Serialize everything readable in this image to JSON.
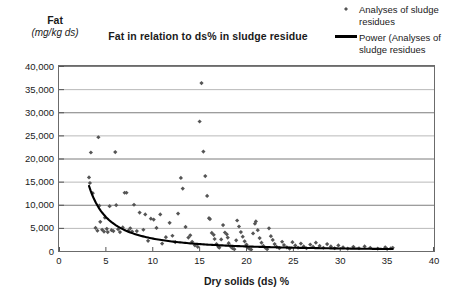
{
  "chart_data": {
    "type": "scatter",
    "title": "Fat in relation to ds% in sludge residue",
    "ylabel_main": "Fat",
    "ylabel_units": "(mg/kg ds)",
    "xlabel": "Dry solids (ds) %",
    "xlim": [
      0,
      40
    ],
    "ylim": [
      0,
      40000
    ],
    "xticks": [
      0,
      5,
      10,
      15,
      20,
      25,
      30,
      35,
      40
    ],
    "xtick_labels": [
      "0",
      "5",
      "10",
      "15",
      "20",
      "25",
      "30",
      "35",
      "40"
    ],
    "yticks": [
      0,
      5000,
      10000,
      15000,
      20000,
      25000,
      30000,
      35000,
      40000
    ],
    "ytick_labels": [
      "0",
      "5,000",
      "10,000",
      "15,000",
      "20,000",
      "25,000",
      "30,000",
      "35,000",
      "40,000"
    ],
    "grid": "horizontal",
    "grid_color": "#9a9a9a",
    "legend_position": "top-right",
    "marker_color": "#555555",
    "marker_shape": "diamond",
    "trendline_color": "#000000",
    "legend": [
      {
        "label": "Analyses of sludge residues",
        "kind": "marker"
      },
      {
        "label": "Power (Analyses of sludge residues",
        "kind": "line"
      }
    ],
    "trendline": {
      "type": "power",
      "coefficient": 76000,
      "exponent": -1.45,
      "x_start": 3.2,
      "x_end": 35.6
    },
    "series": [
      {
        "name": "Analyses of sludge residues",
        "points": [
          [
            4.2,
            24600
          ],
          [
            3.4,
            21300
          ],
          [
            3.2,
            15900
          ],
          [
            3.3,
            14700
          ],
          [
            3.6,
            12500
          ],
          [
            3.9,
            5000
          ],
          [
            4.1,
            4400
          ],
          [
            4.3,
            9800
          ],
          [
            4.4,
            6300
          ],
          [
            4.6,
            4600
          ],
          [
            4.8,
            4200
          ],
          [
            4.9,
            7200
          ],
          [
            5.1,
            4800
          ],
          [
            5.2,
            4100
          ],
          [
            5.4,
            9700
          ],
          [
            5.6,
            4500
          ],
          [
            5.8,
            4300
          ],
          [
            6.0,
            21400
          ],
          [
            6.1,
            9900
          ],
          [
            6.3,
            4700
          ],
          [
            6.5,
            4100
          ],
          [
            6.8,
            5100
          ],
          [
            7.0,
            12600
          ],
          [
            7.2,
            12600
          ],
          [
            7.4,
            4400
          ],
          [
            7.6,
            4900
          ],
          [
            7.8,
            4200
          ],
          [
            8.0,
            10000
          ],
          [
            8.3,
            4300
          ],
          [
            8.6,
            8300
          ],
          [
            9.0,
            4600
          ],
          [
            9.2,
            7900
          ],
          [
            9.5,
            2200
          ],
          [
            9.8,
            7000
          ],
          [
            10.1,
            6800
          ],
          [
            10.4,
            5000
          ],
          [
            10.8,
            7900
          ],
          [
            11.0,
            1600
          ],
          [
            11.4,
            3000
          ],
          [
            11.8,
            6100
          ],
          [
            12.1,
            3300
          ],
          [
            12.4,
            1900
          ],
          [
            12.7,
            8100
          ],
          [
            13.0,
            15800
          ],
          [
            13.2,
            13500
          ],
          [
            13.5,
            5200
          ],
          [
            13.8,
            2900
          ],
          [
            14.0,
            3400
          ],
          [
            14.2,
            2000
          ],
          [
            14.5,
            1200
          ],
          [
            14.8,
            900
          ],
          [
            15.0,
            28000
          ],
          [
            15.2,
            36300
          ],
          [
            15.4,
            21500
          ],
          [
            15.6,
            16200
          ],
          [
            15.8,
            11900
          ],
          [
            16.0,
            7100
          ],
          [
            16.1,
            6900
          ],
          [
            16.3,
            3900
          ],
          [
            16.5,
            3500
          ],
          [
            16.6,
            2600
          ],
          [
            16.8,
            1500
          ],
          [
            17.0,
            900
          ],
          [
            17.1,
            700
          ],
          [
            17.3,
            2500
          ],
          [
            17.5,
            5600
          ],
          [
            17.7,
            4000
          ],
          [
            17.9,
            3600
          ],
          [
            18.0,
            2900
          ],
          [
            18.1,
            1700
          ],
          [
            18.3,
            1000
          ],
          [
            18.5,
            600
          ],
          [
            18.7,
            400
          ],
          [
            18.9,
            2300
          ],
          [
            19.0,
            6600
          ],
          [
            19.2,
            5300
          ],
          [
            19.4,
            4100
          ],
          [
            19.6,
            3100
          ],
          [
            19.8,
            2100
          ],
          [
            20.0,
            1400
          ],
          [
            20.1,
            800
          ],
          [
            20.3,
            500
          ],
          [
            20.5,
            300
          ],
          [
            20.7,
            3800
          ],
          [
            20.9,
            5900
          ],
          [
            21.0,
            6400
          ],
          [
            21.2,
            4500
          ],
          [
            21.4,
            2800
          ],
          [
            21.6,
            1800
          ],
          [
            21.8,
            1100
          ],
          [
            22.0,
            700
          ],
          [
            22.2,
            400
          ],
          [
            22.4,
            4900
          ],
          [
            22.6,
            3200
          ],
          [
            22.8,
            2400
          ],
          [
            23.0,
            1500
          ],
          [
            23.2,
            900
          ],
          [
            23.5,
            600
          ],
          [
            23.8,
            2000
          ],
          [
            24.0,
            1300
          ],
          [
            24.3,
            800
          ],
          [
            24.6,
            500
          ],
          [
            24.9,
            1900
          ],
          [
            25.2,
            1200
          ],
          [
            25.5,
            700
          ],
          [
            25.8,
            1600
          ],
          [
            26.1,
            1000
          ],
          [
            26.4,
            600
          ],
          [
            26.8,
            1400
          ],
          [
            27.1,
            900
          ],
          [
            27.4,
            1800
          ],
          [
            27.8,
            1100
          ],
          [
            28.2,
            700
          ],
          [
            28.6,
            1500
          ],
          [
            29.0,
            1000
          ],
          [
            29.4,
            600
          ],
          [
            29.8,
            1200
          ],
          [
            30.3,
            800
          ],
          [
            30.8,
            500
          ],
          [
            31.4,
            900
          ],
          [
            32.0,
            600
          ],
          [
            32.6,
            1000
          ],
          [
            33.2,
            700
          ],
          [
            34.0,
            500
          ],
          [
            34.8,
            800
          ],
          [
            35.4,
            600
          ],
          [
            35.6,
            700
          ]
        ]
      }
    ]
  }
}
